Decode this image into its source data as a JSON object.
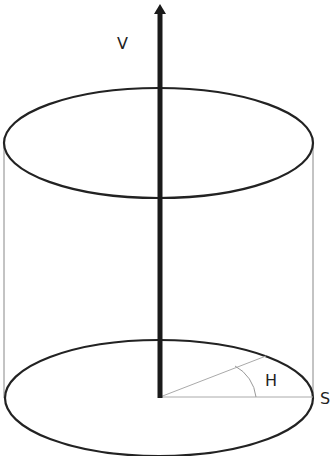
{
  "diagram": {
    "labels": {
      "vertical_axis": "V",
      "angle": "H",
      "radius_end": "S"
    },
    "colors": {
      "stroke": "#222222",
      "thin_line": "#999999",
      "axis": "#1a1a1a"
    }
  }
}
